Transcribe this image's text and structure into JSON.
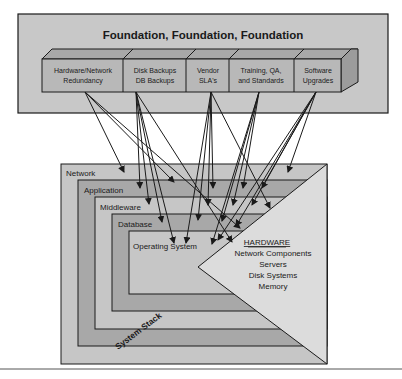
{
  "foundation": {
    "title": "Foundation, Foundation, Foundation",
    "blocks": [
      {
        "line1": "Hardware/Network",
        "line2": "Redundancy"
      },
      {
        "line1": "Disk Backups",
        "line2": "DB Backups"
      },
      {
        "line1": "Vendor",
        "line2": "SLA's"
      },
      {
        "line1": "Training, QA,",
        "line2": "and Standards"
      },
      {
        "line1": "Software",
        "line2": "Upgrades"
      }
    ]
  },
  "stack": {
    "label": "System Stack",
    "layers": [
      "Network",
      "Application",
      "Middleware",
      "Database",
      "Operating System"
    ]
  },
  "hardware": {
    "title": "HARDWARE",
    "items": [
      "Network Components",
      "Servers",
      "Disk Systems",
      "Memory"
    ]
  },
  "colors": {
    "foundation_bg": "#c8c8c8",
    "block_face": "#b4b4b4",
    "block_top": "#a8a8a8",
    "layer_outer": "#c4c4c4",
    "layer_dark": "#a6a6a6",
    "hardware_bg": "#dcdcdc",
    "line": "#1a1a1a"
  }
}
